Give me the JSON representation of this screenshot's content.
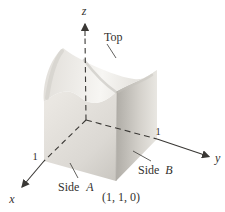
{
  "figure": {
    "type": "3d-surface-over-unit-square-diagram",
    "axis_labels": {
      "x": "x",
      "y": "y",
      "z": "z"
    },
    "ticks": {
      "x_one": "1",
      "y_one": "1"
    },
    "annotations": {
      "top": "Top",
      "side_a": {
        "word": "Side",
        "letter": "A"
      },
      "side_b": {
        "word": "Side",
        "letter": "B"
      },
      "corner_point": "(1, 1, 0)"
    },
    "colors": {
      "background": "#ffffff",
      "line": "#3a3835",
      "text": "#33312e",
      "side_a_light": "#eae7e2",
      "side_a_dark": "#c7c4be",
      "side_b_dark": "#b1aea8",
      "side_b_light": "#eae8e3",
      "top_left_shade": "#e2dfda",
      "top_bright": "#f7f6f3",
      "top_right_shade": "#d9d6d0",
      "fold_shade": "#b9b6b0"
    }
  }
}
